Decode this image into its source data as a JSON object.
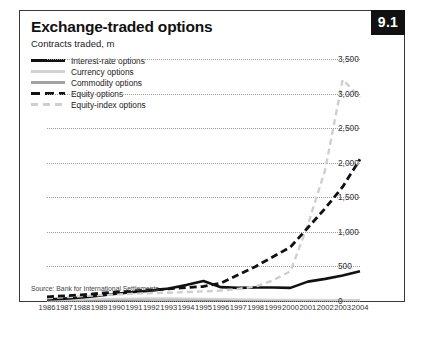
{
  "figure": {
    "number": "9.1",
    "title": "Exchange-traded options",
    "subtitle": "Contracts traded, m",
    "source": "Source: Bank for International Settlements"
  },
  "legend": [
    {
      "label": "Interest-rate options",
      "style": "s-solid-black",
      "color": "#111111"
    },
    {
      "label": "Currency options",
      "style": "s-solid-light",
      "color": "#d2d2d2"
    },
    {
      "label": "Commodity options",
      "style": "s-solid-mid",
      "color": "#a2a2a2"
    },
    {
      "label": "Equity options",
      "style": "s-dash-black",
      "color": "#111111"
    },
    {
      "label": "Equity-index options",
      "style": "s-dash-light",
      "color": "#cfcfcf"
    }
  ],
  "chart_data": {
    "type": "line",
    "title": "Exchange-traded options",
    "subtitle": "Contracts traded, m",
    "xlabel": "",
    "ylabel": "Contracts traded, m",
    "ylim": [
      0,
      3500
    ],
    "yticks": [
      0,
      500,
      1000,
      1500,
      2000,
      2500,
      3000,
      3500
    ],
    "ytick_labels": [
      "0",
      "500",
      "1,000",
      "1,500",
      "2,000",
      "2,500",
      "3,000",
      "3,500"
    ],
    "grid": true,
    "legend_position": "top-left",
    "categories": [
      1986,
      1987,
      1988,
      1989,
      1990,
      1991,
      1992,
      1993,
      1994,
      1995,
      1996,
      1997,
      1998,
      1999,
      2000,
      2001,
      2002,
      2003,
      2004
    ],
    "series": [
      {
        "name": "Interest-rate options",
        "values": [
          22,
          35,
          50,
          75,
          105,
          130,
          150,
          180,
          230,
          290,
          200,
          190,
          195,
          195,
          190,
          280,
          320,
          370,
          430
        ]
      },
      {
        "name": "Currency options",
        "values": [
          10,
          16,
          22,
          30,
          35,
          38,
          40,
          40,
          38,
          35,
          30,
          25,
          22,
          20,
          18,
          16,
          15,
          14,
          14
        ]
      },
      {
        "name": "Commodity options",
        "values": [
          5,
          7,
          9,
          11,
          12,
          13,
          14,
          14,
          14,
          13,
          12,
          11,
          10,
          10,
          10,
          10,
          10,
          11,
          12
        ]
      },
      {
        "name": "Equity options",
        "values": [
          60,
          75,
          90,
          110,
          130,
          145,
          160,
          175,
          195,
          210,
          260,
          380,
          500,
          640,
          780,
          1060,
          1340,
          1650,
          2050
        ]
      },
      {
        "name": "Equity-index options",
        "values": [
          40,
          55,
          70,
          85,
          95,
          105,
          115,
          120,
          130,
          140,
          150,
          175,
          210,
          300,
          430,
          1100,
          1900,
          3200,
          2950
        ]
      }
    ]
  }
}
